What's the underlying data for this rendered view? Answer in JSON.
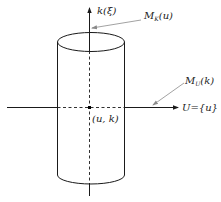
{
  "diagram": {
    "vertical_axis": {
      "label_main": "k",
      "label_arg": "(ξ)"
    },
    "horizontal_axis": {
      "label": "U={u}"
    },
    "point": {
      "label": "(u, k)"
    },
    "annotations": [
      {
        "id": "mk",
        "main": "M",
        "sub": "K",
        "arg": "(u)"
      },
      {
        "id": "mu",
        "main": "M",
        "sub": "U",
        "arg": "(k)"
      }
    ],
    "colors": {
      "line": "#1a1a1a",
      "pointer": "#8a8a8a",
      "text": "#222222"
    }
  }
}
